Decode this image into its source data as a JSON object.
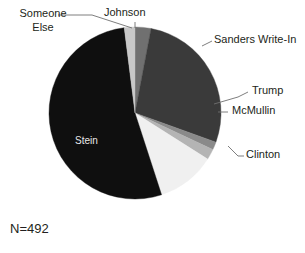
{
  "chart_data": {
    "type": "pie",
    "title": "",
    "annotation": "N=492",
    "total_n": 492,
    "legend_position": "callout-labels",
    "categories": [
      "Johnson",
      "Sanders Write-In",
      "Trump",
      "McMullin",
      "Clinton",
      "Stein",
      "Someone Else"
    ],
    "values": [
      3.0,
      27.5,
      1.5,
      2.0,
      11.0,
      53.0,
      2.0
    ],
    "value_unit": "percent",
    "start_angle_deg": 0,
    "direction": "clockwise",
    "slices": [
      {
        "label": "Johnson",
        "percent": 3.0,
        "start_deg": 0.0,
        "end_deg": 10.8,
        "color": "#707070"
      },
      {
        "label": "Sanders Write-In",
        "percent": 27.5,
        "start_deg": 10.8,
        "end_deg": 109.8,
        "color": "#3a3a3a"
      },
      {
        "label": "Trump",
        "percent": 1.5,
        "start_deg": 109.8,
        "end_deg": 115.2,
        "color": "#8a8a8a"
      },
      {
        "label": "McMullin",
        "percent": 2.0,
        "start_deg": 115.2,
        "end_deg": 122.4,
        "color": "#b4b4b4"
      },
      {
        "label": "Clinton",
        "percent": 11.0,
        "start_deg": 122.4,
        "end_deg": 162.0,
        "color": "#f0f0f0"
      },
      {
        "label": "Stein",
        "percent": 53.0,
        "start_deg": 162.0,
        "end_deg": 352.8,
        "color": "#0f0f0f"
      },
      {
        "label": "Someone Else",
        "percent": 2.0,
        "start_deg": 352.8,
        "end_deg": 360.0,
        "color": "#c8c8c8"
      }
    ],
    "geometry": {
      "cx": 135,
      "cy": 113,
      "r": 86
    }
  },
  "labels": {
    "someone_else": "Someone Else",
    "johnson": "Johnson",
    "sanders_write_in": "Sanders Write-In",
    "trump": "Trump",
    "mcmullin": "McMullin",
    "clinton": "Clinton",
    "stein": "Stein",
    "sample_size": "N=492"
  },
  "colors": {
    "text": "#231f20",
    "inside_text": "#e8e8e8",
    "leader_line": "#6f6f6f",
    "background": "#ffffff"
  }
}
